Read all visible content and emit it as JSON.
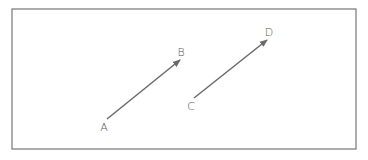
{
  "diagram": {
    "type": "vector-diagram",
    "frame": {
      "x": 12,
      "y": 9,
      "width": 344,
      "height": 140,
      "stroke": "#8a8a8a"
    },
    "line_color": "#6a6a6a",
    "label_color": "#555555",
    "points": {
      "A": {
        "label": "A",
        "x": 107,
        "y": 119,
        "label_x": 104,
        "label_y": 131
      },
      "B": {
        "label": "B",
        "x": 180,
        "y": 60,
        "label_x": 181,
        "label_y": 56
      },
      "C": {
        "label": "C",
        "x": 194,
        "y": 98,
        "label_x": 191,
        "label_y": 110
      },
      "D": {
        "label": "D",
        "x": 267,
        "y": 40,
        "label_x": 269,
        "label_y": 36
      }
    },
    "vectors": [
      {
        "id": "AB",
        "from": "A",
        "to": "B"
      },
      {
        "id": "CD",
        "from": "C",
        "to": "D"
      }
    ]
  }
}
